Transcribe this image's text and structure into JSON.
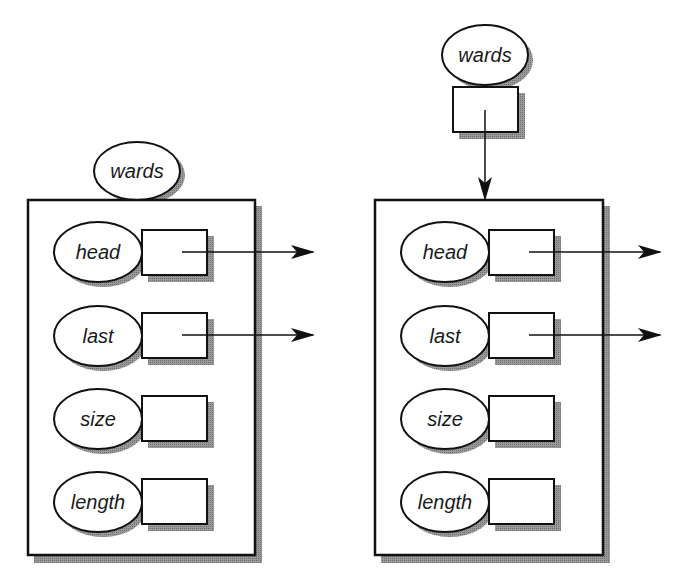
{
  "diagram": {
    "colors": {
      "stroke": "#111111",
      "shadow": "#8a8a8a",
      "fill": "#ffffff"
    },
    "left": {
      "title": "wards",
      "fields": [
        {
          "label": "head",
          "has_pointer": true
        },
        {
          "label": "last",
          "has_pointer": true
        },
        {
          "label": "size",
          "has_pointer": false
        },
        {
          "label": "length",
          "has_pointer": false
        }
      ]
    },
    "right": {
      "title": "wards",
      "pointer_box": true,
      "fields": [
        {
          "label": "head",
          "has_pointer": true
        },
        {
          "label": "last",
          "has_pointer": true
        },
        {
          "label": "size",
          "has_pointer": false
        },
        {
          "label": "length",
          "has_pointer": false
        }
      ]
    }
  }
}
